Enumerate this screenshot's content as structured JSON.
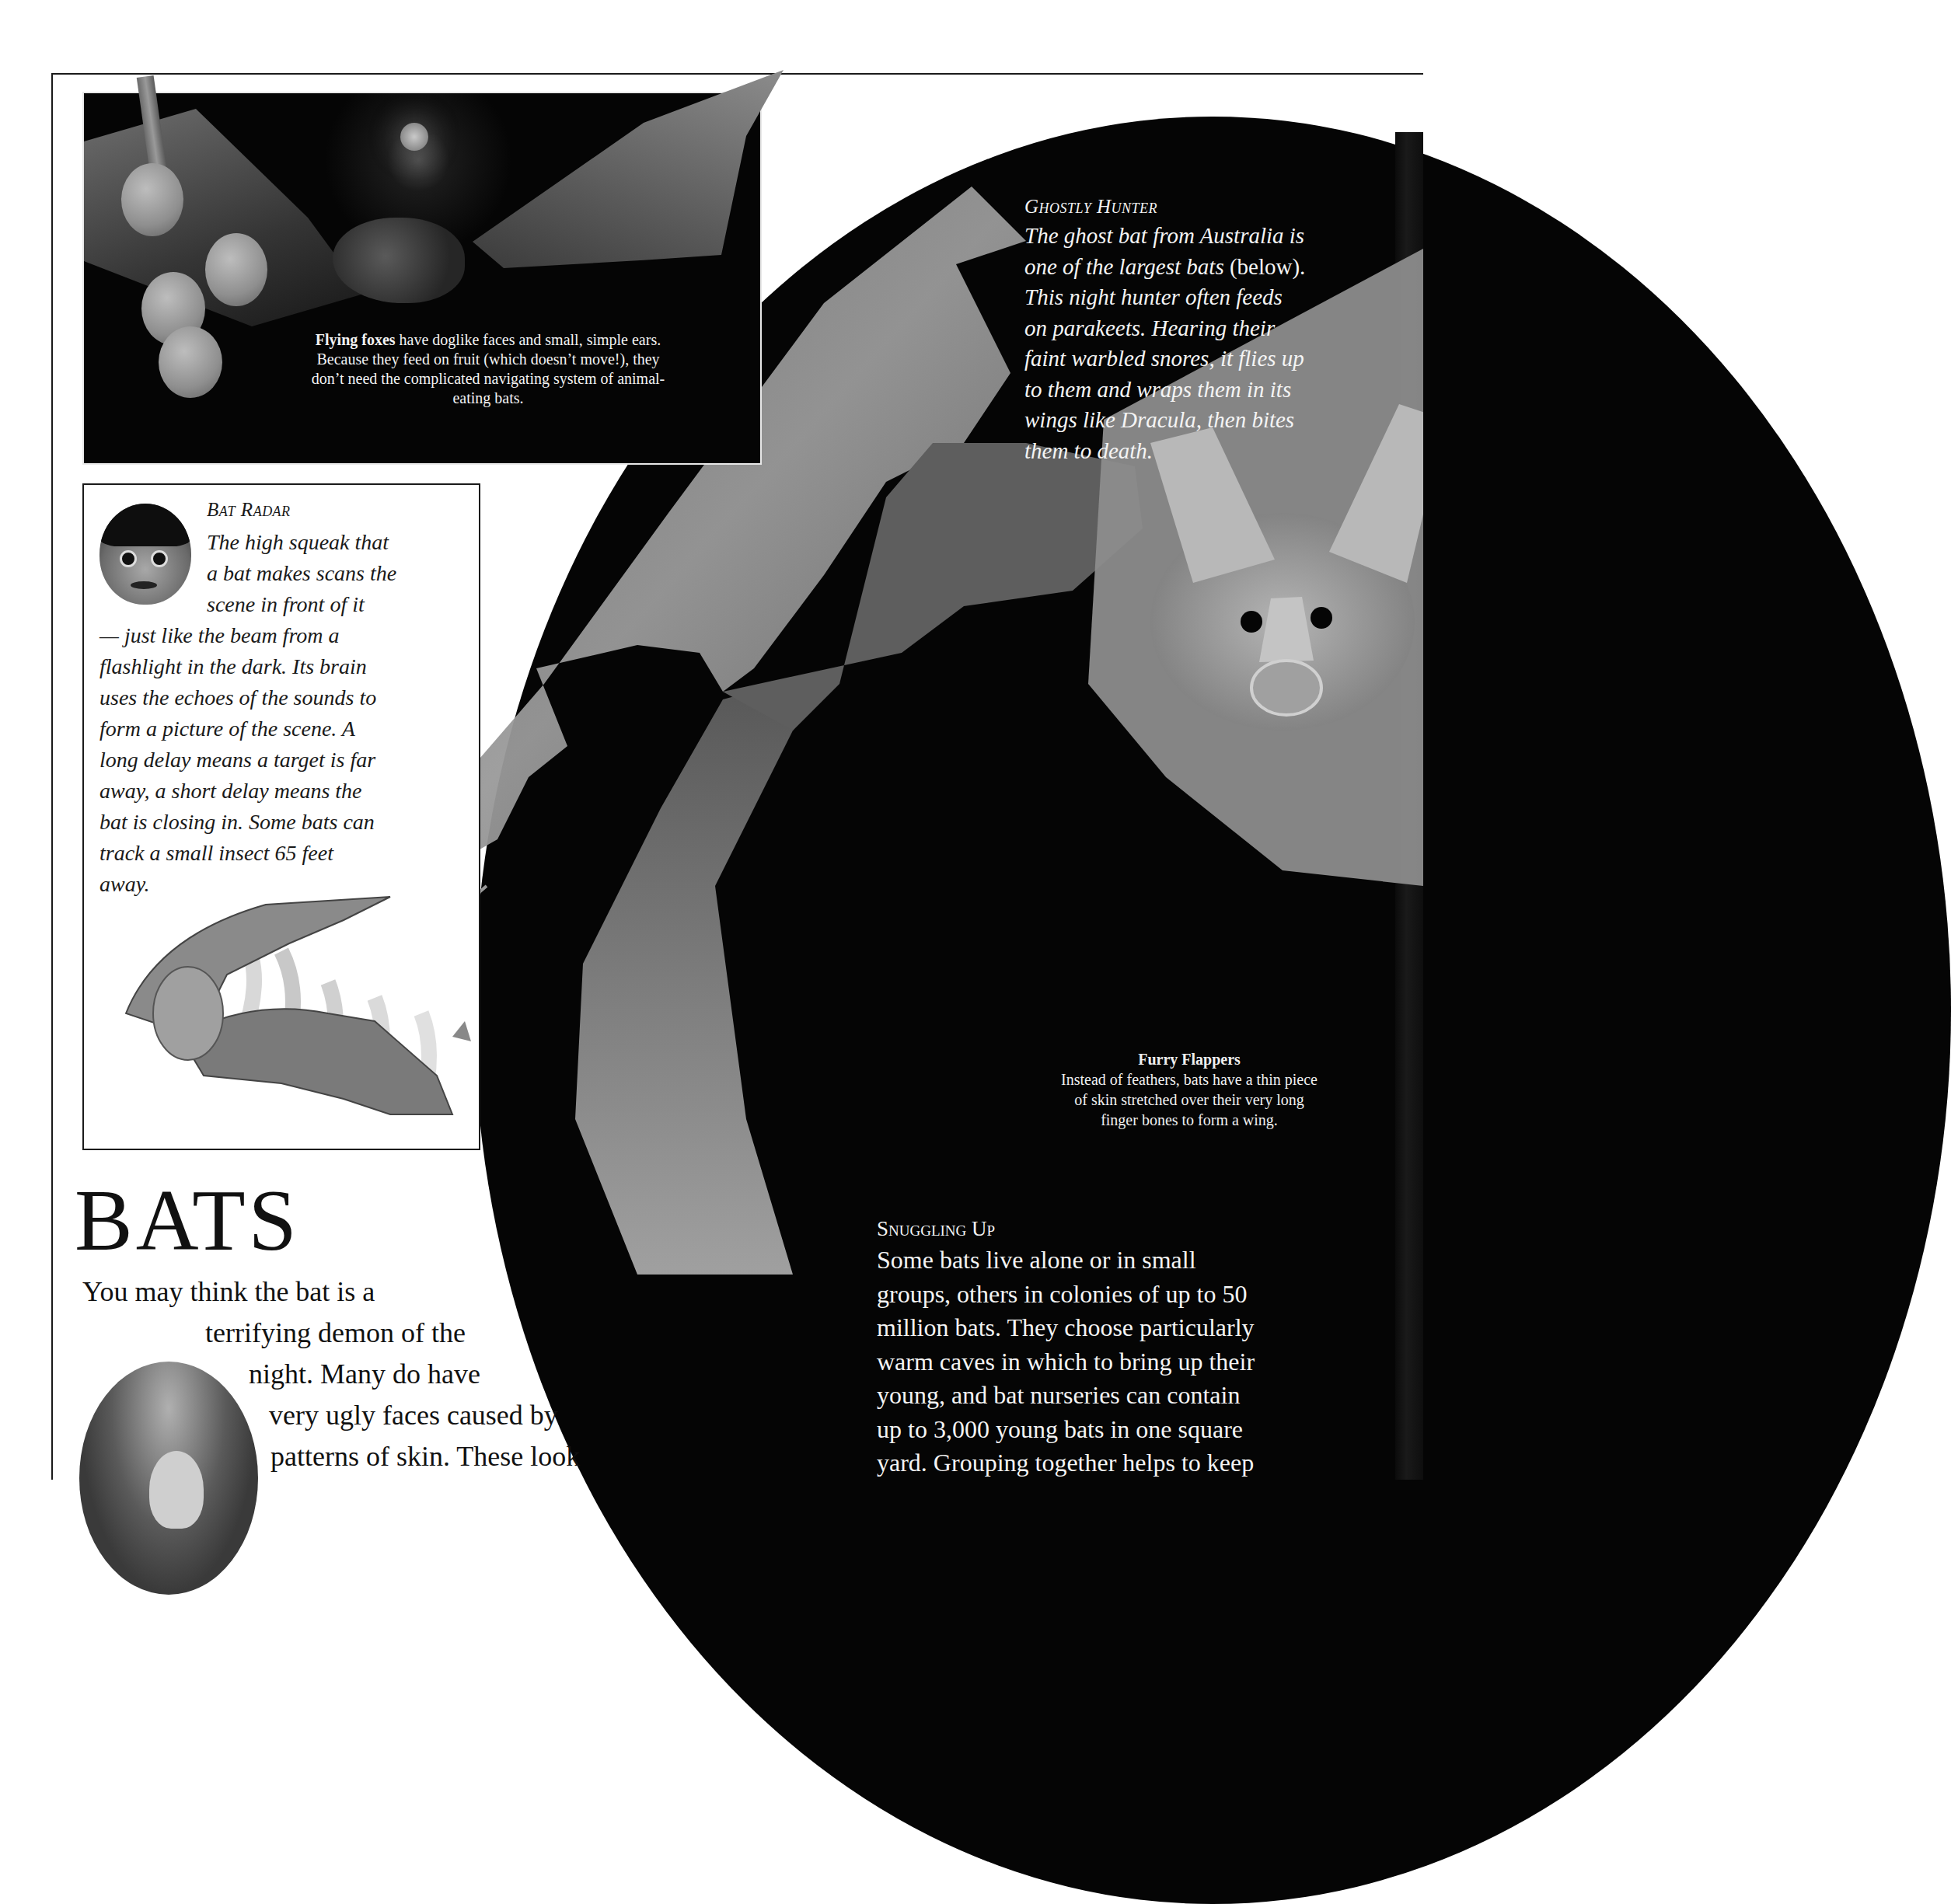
{
  "page": {
    "title": "BATS",
    "intro_lines": [
      "You may think the bat is a",
      "terrifying demon of the",
      "night. Many do have",
      "very ugly faces caused by",
      "patterns of skin. These look"
    ]
  },
  "flying_foxes": {
    "lead": "Flying foxes",
    "caption_rest": " have doglike faces and small, simple ears. Because they feed on fruit (which doesn’t move!), they don’t need the complicated navigating system of animal-eating bats.",
    "illustration": "flying-fox-with-fruit-and-moon"
  },
  "bat_radar": {
    "title": "Bat Radar",
    "lines_indented": [
      "The high squeak that",
      "a bat makes scans the",
      "scene in front of it"
    ],
    "lines": [
      "— just like the beam from a",
      "flashlight in the dark. Its brain",
      "uses the echoes of the sounds to",
      "form a picture of the scene. A",
      "long delay means a target is far",
      "away, a short delay means the",
      "bat is closing in. Some bats can",
      "track a small insect 65 feet",
      "away."
    ],
    "face_image": "startled-boy-face",
    "illustration": "bat-echolocating-moth"
  },
  "ghostly_hunter": {
    "title": "Ghostly Hunter",
    "lines": [
      {
        "italic": "The ghost bat from Australia is",
        "roman": ""
      },
      {
        "italic": "one of the largest bats ",
        "roman": "(below)."
      },
      {
        "italic": "This night hunter often feeds",
        "roman": ""
      },
      {
        "italic": "on parakeets. Hearing their",
        "roman": ""
      },
      {
        "italic": "faint warbled snores, it flies up",
        "roman": ""
      },
      {
        "italic": "to them and wraps them in its",
        "roman": ""
      },
      {
        "italic": "wings like Dracula, then bites",
        "roman": ""
      },
      {
        "italic": "them to death.",
        "roman": ""
      }
    ],
    "illustration": "ghost-bat"
  },
  "furry_flappers": {
    "title": "Furry Flappers",
    "lines": [
      "Instead of feathers, bats have a thin piece",
      "of skin stretched over their very long",
      "finger bones to form a wing."
    ]
  },
  "snuggling_up": {
    "title": "Snuggling Up",
    "lines": [
      "Some bats live alone or in small",
      "groups, others in colonies of up to 50",
      "million bats. They choose particularly",
      "warm caves in which to bring up their",
      "young, and bat nurseries can contain",
      "up to 3,000 young bats in one square",
      "yard. Grouping together helps to keep"
    ]
  },
  "colors": {
    "ink": "#111111",
    "night": "#050505",
    "paper": "#ffffff",
    "reverse_text": "#f4f4f4"
  }
}
